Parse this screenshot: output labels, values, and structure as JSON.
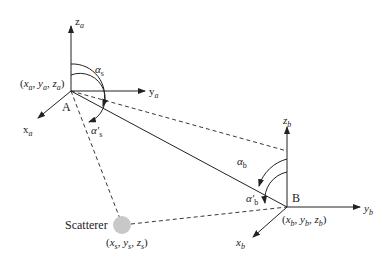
{
  "diagram": {
    "type": "bistatic geometry",
    "nodes": {
      "A": {
        "label": "A",
        "coords_label": "(x_a, y_a, z_a)",
        "coords": {
          "x": "x",
          "xs": "a",
          "y": "y",
          "ys": "a",
          "z": "z",
          "zs": "a"
        },
        "axes": {
          "z": "z",
          "zs": "a",
          "y": "y",
          "ys": "a",
          "x": "x",
          "xs": "a"
        },
        "angles": {
          "alpha": {
            "sym": "α",
            "sub": "s"
          },
          "alpha_prime": {
            "sym": "α′",
            "sub": "s"
          }
        }
      },
      "B": {
        "label": "B",
        "coords_label": "(x_b, y_b, z_b)",
        "coords": {
          "x": "x",
          "xs": "b",
          "y": "y",
          "ys": "b",
          "z": "z",
          "zs": "b"
        },
        "axes": {
          "z": "z",
          "zs": "b",
          "y": "y",
          "ys": "b",
          "x": "x",
          "xs": "b"
        },
        "angles": {
          "alpha": {
            "sym": "α",
            "sub": "b"
          },
          "alpha_prime": {
            "sym": "α′",
            "sub": "b"
          }
        }
      },
      "scatterer": {
        "label": "Scatterer",
        "coords_label": "(x_s, y_s, z_s)",
        "coords": {
          "x": "x",
          "xs": "s",
          "y": "y",
          "ys": "s",
          "z": "z",
          "zs": "s"
        },
        "color": "#c8c8c8"
      }
    },
    "edges": [
      {
        "from": "A",
        "to": "B",
        "style": "solid"
      },
      {
        "from": "A",
        "to": "B-z-axis",
        "style": "dashed"
      },
      {
        "from": "A",
        "to": "scatterer",
        "style": "dashed"
      },
      {
        "from": "scatterer",
        "to": "B",
        "style": "dashed"
      }
    ],
    "colors": {
      "line": "#222222",
      "scatterer": "#c8c8c8"
    }
  }
}
